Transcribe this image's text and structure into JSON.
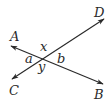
{
  "diagram": {
    "type": "intersecting-lines",
    "colors": {
      "ink": "#2a2a2a",
      "background": "#ffffff"
    },
    "lines": [
      {
        "name": "AB",
        "from": "A",
        "to": "B",
        "x1": 11,
        "y1": 46,
        "x2": 103,
        "y2": 84
      },
      {
        "name": "CD",
        "from": "C",
        "to": "D",
        "x1": 12,
        "y1": 79,
        "x2": 104,
        "y2": 19
      }
    ],
    "points": {
      "A": {
        "label": "A",
        "x": 10,
        "y": 41
      },
      "B": {
        "label": "B",
        "x": 94,
        "y": 99
      },
      "C": {
        "label": "C",
        "x": 9,
        "y": 95
      },
      "D": {
        "label": "D",
        "x": 94,
        "y": 17
      }
    },
    "angles": {
      "x": {
        "label": "x",
        "x": 40,
        "y": 51
      },
      "a": {
        "label": "a",
        "x": 25,
        "y": 63
      },
      "y": {
        "label": "y",
        "x": 38,
        "y": 71
      },
      "b": {
        "label": "b",
        "x": 57,
        "y": 63
      }
    }
  }
}
